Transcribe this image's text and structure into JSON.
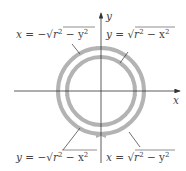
{
  "diagram": {
    "axes": {
      "x_label": "x",
      "y_label": "y"
    },
    "labels": {
      "top_left": {
        "lhs": "x = −",
        "rad": "r",
        "exp1": "2",
        "mid": " − y",
        "exp2": "2"
      },
      "top_right": {
        "lhs": "y = ",
        "rad": "r",
        "exp1": "2",
        "mid": " − x",
        "exp2": "2"
      },
      "bottom_left": {
        "lhs": "y = −",
        "rad": "r",
        "exp1": "2",
        "mid": " − x",
        "exp2": "2"
      },
      "bottom_right": {
        "lhs": "x = ",
        "rad": "r",
        "exp1": "2",
        "mid": " − y",
        "exp2": "2"
      }
    },
    "colors": {
      "circle": "#b3b3b3",
      "axis": "#333333",
      "text": "#444444"
    }
  }
}
